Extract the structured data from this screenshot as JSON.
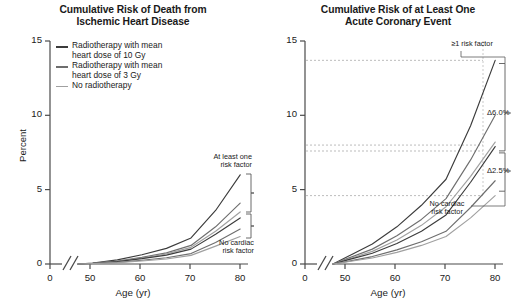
{
  "figure": {
    "width": 531,
    "height": 303,
    "background": "#ffffff"
  },
  "panels": [
    {
      "id": "left",
      "title_line1": "Cumulative Risk of Death from",
      "title_line2": "Ischemic Heart Disease",
      "ylabel": "Percent",
      "xlabel": "Age (yr)",
      "yticks": [
        "0",
        "5",
        "10",
        "15"
      ],
      "xticks": [
        "0",
        "50",
        "60",
        "70",
        "80"
      ],
      "annotations": {
        "upper_line1": "At least one",
        "upper_line2": "risk factor",
        "lower_line1": "No cardiac",
        "lower_line2": "risk factor"
      }
    },
    {
      "id": "right",
      "title_line1": "Cumulative Risk of at Least One",
      "title_line2": "Acute Coronary Event",
      "ylabel": "",
      "xlabel": "Age (yr)",
      "yticks": [
        "0",
        "5",
        "10",
        "15"
      ],
      "xticks": [
        "0",
        "50",
        "60",
        "70",
        "80"
      ],
      "annotations": {
        "upper_line1": "≥1 risk factor",
        "lower_line1": "No cardiac",
        "lower_line2": "risk factor",
        "delta_upper": "Δ6.0%",
        "delta_lower": "Δ2.5%"
      }
    }
  ],
  "legend": {
    "items": [
      {
        "label_line1": "Radiotherapy with mean",
        "label_line2": "heart dose of 10 Gy",
        "color": "#3c3c3c"
      },
      {
        "label_line1": "Radiotherapy with mean",
        "label_line2": "heart dose of 3 Gy",
        "color": "#6e6e6e"
      },
      {
        "label_line1": "No radiotherapy",
        "label_line2": "",
        "color": "#a0a0a0"
      }
    ]
  },
  "colors": {
    "axis": "#4a4a4a",
    "text": "#1a1a1a",
    "grid_dashed": "#aaaaaa",
    "bracket": "#5a5a5a",
    "dose10": "#3c3c3c",
    "dose3": "#6e6e6e",
    "dose0": "#a0a0a0"
  },
  "chart_data": {
    "type": "line",
    "xlabel": "Age (yr)",
    "ylabel": "Percent",
    "xlim": [
      47,
      82
    ],
    "ylim": [
      0,
      15
    ],
    "grid": false,
    "legend_position": "upper-left-panel-1",
    "x": [
      47,
      50,
      55,
      60,
      65,
      70,
      75,
      80
    ],
    "panels": [
      {
        "name": "Cumulative Risk of Death from Ischemic Heart Disease",
        "series": [
          {
            "name": "10 Gy, at least one risk factor",
            "color": "#3c3c3c",
            "values": [
              0,
              0.07,
              0.28,
              0.62,
              1.05,
              1.75,
              3.6,
              6.0
            ]
          },
          {
            "name": "3 Gy, at least one risk factor",
            "color": "#6e6e6e",
            "values": [
              0,
              0.05,
              0.2,
              0.45,
              0.75,
              1.25,
              2.5,
              4.1
            ]
          },
          {
            "name": "No radiotherapy, at least one risk factor",
            "color": "#a0a0a0",
            "values": [
              0,
              0.045,
              0.18,
              0.4,
              0.68,
              1.12,
              2.2,
              3.5
            ]
          },
          {
            "name": "10 Gy, no cardiac risk factor",
            "color": "#3c3c3c",
            "values": [
              0,
              0.04,
              0.16,
              0.36,
              0.6,
              1.0,
              2.0,
              3.1
            ]
          },
          {
            "name": "3 Gy, no cardiac risk factor",
            "color": "#6e6e6e",
            "values": [
              0,
              0.03,
              0.11,
              0.25,
              0.42,
              0.7,
              1.45,
              2.35
            ]
          },
          {
            "name": "No radiotherapy, no cardiac risk factor",
            "color": "#a0a0a0",
            "values": [
              0,
              0.025,
              0.09,
              0.2,
              0.34,
              0.58,
              1.2,
              1.85
            ]
          }
        ]
      },
      {
        "name": "Cumulative Risk of at Least One Acute Coronary Event",
        "series": [
          {
            "name": "10 Gy, at least one risk factor",
            "color": "#3c3c3c",
            "values": [
              0,
              0.5,
              1.35,
              2.5,
              3.95,
              5.7,
              9.3,
              13.7
            ]
          },
          {
            "name": "3 Gy, at least one risk factor",
            "color": "#6e6e6e",
            "values": [
              0,
              0.38,
              1.0,
              1.9,
              3.0,
              4.4,
              7.0,
              10.0
            ]
          },
          {
            "name": "No radiotherapy, at least one risk factor",
            "color": "#a0a0a0",
            "values": [
              0,
              0.32,
              0.85,
              1.62,
              2.6,
              3.85,
              5.9,
              8.2
            ]
          },
          {
            "name": "10 Gy, no cardiac risk factor",
            "color": "#3c3c3c",
            "values": [
              0,
              0.28,
              0.72,
              1.38,
              2.2,
              3.3,
              5.5,
              7.9
            ]
          },
          {
            "name": "3 Gy, no cardiac risk factor",
            "color": "#6e6e6e",
            "values": [
              0,
              0.18,
              0.5,
              0.95,
              1.5,
              2.2,
              3.8,
              5.6
            ]
          },
          {
            "name": "No radiotherapy, no cardiac risk factor",
            "color": "#a0a0a0",
            "values": [
              0,
              0.15,
              0.4,
              0.78,
              1.25,
              1.85,
              3.1,
              4.6
            ]
          }
        ],
        "reference_lines": [
          13.7,
          8.0,
          7.6,
          4.6
        ],
        "annotations": [
          {
            "text": "Δ6.0%",
            "span": [
              7.6,
              13.7
            ]
          },
          {
            "text": "Δ2.5%",
            "span": [
              4.6,
              7.6
            ]
          }
        ]
      }
    ]
  }
}
